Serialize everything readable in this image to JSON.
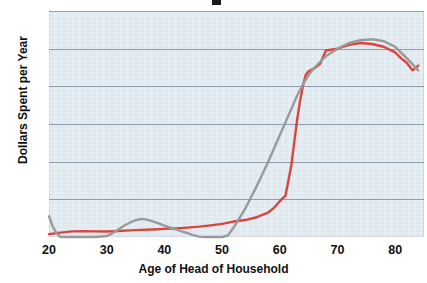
{
  "chart_data": {
    "type": "line",
    "title": "",
    "xlabel": "Age of Head of Household",
    "ylabel": "Dollars Spent per Year",
    "xlim": [
      20,
      85
    ],
    "ylim": [
      0,
      120
    ],
    "xticks": [
      20,
      30,
      40,
      50,
      60,
      70,
      80
    ],
    "yticks": [
      0,
      20,
      40,
      60,
      80,
      100,
      120
    ],
    "grid": true,
    "legend": "none",
    "plot_background_color": "#dde8ef",
    "gridline_color": "#8c9fad",
    "series": [
      {
        "name": "red-series",
        "color": "#d9453c",
        "x": [
          20,
          22,
          24,
          26,
          28,
          30,
          32,
          34,
          36,
          38,
          40,
          42,
          44,
          46,
          48,
          50,
          52,
          54,
          56,
          58,
          59,
          60,
          61,
          62,
          63,
          63.5,
          64,
          64.5,
          65,
          66,
          67,
          68,
          70,
          72,
          74,
          76,
          78,
          80,
          81,
          82,
          83,
          84
        ],
        "y": [
          1.5,
          2.3,
          3.0,
          3.1,
          3.0,
          2.9,
          3.2,
          3.5,
          3.8,
          4.0,
          4.3,
          4.6,
          5.0,
          5.5,
          6.2,
          7.0,
          8.2,
          9.0,
          10.5,
          13.0,
          15.5,
          19.0,
          22.0,
          38.0,
          62.0,
          72.0,
          80.0,
          86.0,
          88.0,
          89.5,
          92.0,
          99.0,
          100.0,
          102.0,
          103.0,
          102.5,
          101.0,
          98.0,
          95.0,
          92.5,
          88.5,
          91.0
        ]
      },
      {
        "name": "gray-series",
        "color": "#9a9a9a",
        "x": [
          20,
          20.6,
          21.3,
          22,
          24,
          26,
          28,
          30,
          31,
          32,
          33,
          34,
          35,
          36,
          37,
          38,
          39,
          40,
          41,
          42,
          43,
          44,
          45,
          46,
          47,
          48,
          49,
          50,
          51,
          52,
          54,
          56,
          58,
          60,
          61,
          62,
          63,
          64,
          65,
          66,
          68,
          70,
          72,
          74,
          76,
          78,
          80,
          82,
          84
        ],
        "y": [
          11.0,
          6.0,
          2.0,
          0.0,
          0.0,
          0.0,
          0.0,
          0.5,
          2.0,
          4.0,
          6.0,
          7.6,
          8.9,
          9.6,
          9.2,
          8.3,
          7.2,
          6.0,
          5.0,
          4.0,
          3.0,
          2.0,
          1.0,
          0.2,
          0.0,
          0.0,
          0.0,
          0.0,
          0.8,
          5.0,
          15.0,
          27.0,
          40.0,
          54.0,
          61.0,
          68.0,
          75.0,
          81.0,
          86.0,
          90.0,
          96.0,
          100.0,
          103.0,
          104.5,
          105.0,
          104.0,
          101.0,
          95.0,
          88.5
        ]
      }
    ]
  },
  "axes": {
    "x_tick_labels": [
      "20",
      "30",
      "40",
      "50",
      "60",
      "70",
      "80"
    ],
    "y_tick_labels": [
      "0",
      "20",
      "40",
      "60",
      "80",
      "100",
      "120"
    ],
    "x_axis_title": "Age of Head of Household",
    "y_axis_title": "Dollars Spent per Year"
  }
}
